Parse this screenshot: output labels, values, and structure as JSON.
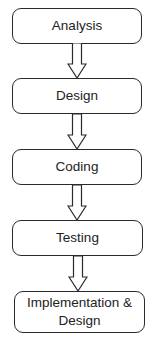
{
  "diagram": {
    "type": "flowchart",
    "direction": "top-to-bottom",
    "nodes": [
      {
        "id": "analysis",
        "label": "Analysis"
      },
      {
        "id": "design",
        "label": "Design"
      },
      {
        "id": "coding",
        "label": "Coding"
      },
      {
        "id": "testing",
        "label": "Testing"
      },
      {
        "id": "implementation",
        "label": "Implementation & Design"
      }
    ],
    "edges": [
      {
        "from": "analysis",
        "to": "design"
      },
      {
        "from": "design",
        "to": "coding"
      },
      {
        "from": "coding",
        "to": "testing"
      },
      {
        "from": "testing",
        "to": "implementation"
      }
    ],
    "colors": {
      "stroke": "#2a2a2a",
      "fill": "#ffffff",
      "text": "#222222"
    }
  }
}
